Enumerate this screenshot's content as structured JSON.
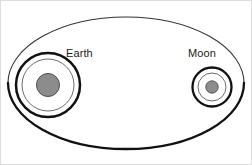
{
  "figure": {
    "type": "astronomy-diagram",
    "width": 252,
    "height": 165,
    "background_color": "#ffffff",
    "border_color": "#d9d9d9"
  },
  "labels": {
    "earth": "Earth",
    "moon": "Moon"
  },
  "colors": {
    "body_fill": "#8c8c8c",
    "body_stroke": "#4d4d4d",
    "thick_orbit_stroke": "#111111",
    "thin_orbit_stroke": "#4a4a4a",
    "ellipse_stroke": "#262626",
    "label_text": "#1a1a1a"
  },
  "geometry": {
    "barycenter_ellipse": {
      "cx": 126,
      "cy": 83,
      "rx": 118,
      "ry": 66,
      "stroke_width_top": 0.9,
      "stroke_width_bottom": 2.0
    },
    "earth": {
      "cx": 48,
      "cy": 85,
      "disk_radius": 11.5,
      "inner_circle_radius": 26,
      "outer_circle_radius": 32,
      "inner_stroke_width": 0.9,
      "outer_stroke_width": 2.4,
      "label_x": 66,
      "label_y": 57
    },
    "moon": {
      "cx": 212,
      "cy": 87,
      "disk_radius": 6.2,
      "inner_circle_radius": 14,
      "outer_circle_radius": 19.5,
      "inner_stroke_width": 0.9,
      "outer_stroke_width": 2.2,
      "label_x": 188,
      "label_y": 57
    }
  }
}
